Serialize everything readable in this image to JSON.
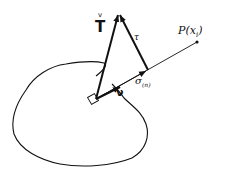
{
  "diagram": {
    "labels": {
      "traction": "T",
      "traction_accent": "v",
      "shear": "τ",
      "normal_stress": "σ",
      "normal_stress_sub": "(n)",
      "normal_vector": "ν",
      "point": "P(x",
      "point_sub": "i",
      "point_close": ")"
    },
    "colors": {
      "stroke": "#111111",
      "background": "#ffffff"
    }
  }
}
